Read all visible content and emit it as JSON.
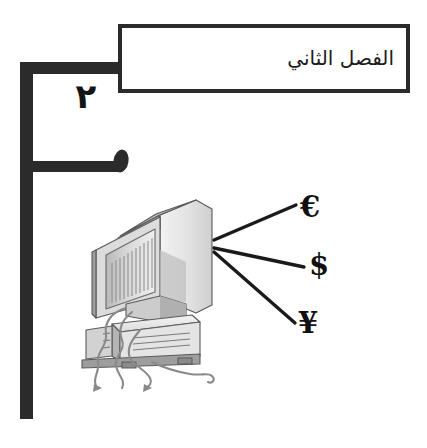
{
  "page": {
    "width": 427,
    "height": 448,
    "background_color": "#ffffff",
    "language": "ar",
    "direction": "rtl"
  },
  "header": {
    "chapter_title": "الفصل الثاني",
    "chapter_number": "٢",
    "frame_color": "#2b2b2b",
    "box_border_color": "#2b2b2b",
    "box_fill_color": "#ffffff",
    "text_color": "#1b1b1b"
  },
  "illustration": {
    "name": "desktop-computer-crt-illustration",
    "description": "CRT monitor on a horizontal computer base unit with trailing cables",
    "line_color": "#5a5a5a",
    "shade_light": "#e9e9e9",
    "shade_mid": "#c9c9c9",
    "shade_dark": "#9a9a9a",
    "shade_darker": "#7d7d7d"
  },
  "currencies": {
    "connector_color": "#1a1a1a",
    "items": [
      {
        "symbol": "€",
        "name": "euro-symbol",
        "icon": "euro-icon"
      },
      {
        "symbol": "$",
        "name": "dollar-symbol",
        "icon": "dollar-icon"
      },
      {
        "symbol": "¥",
        "name": "yen-symbol",
        "icon": "yen-icon"
      }
    ]
  }
}
